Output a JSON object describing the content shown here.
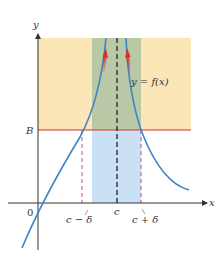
{
  "diagram": {
    "axes": {
      "x_label": "x",
      "y_label": "y",
      "origin_label": "0"
    },
    "labels": {
      "B": "B",
      "c": "c",
      "c_minus_delta": "c − δ",
      "c_plus_delta": "c + δ",
      "curve": "y = f(x)"
    },
    "colors": {
      "upper_region": "#fbe6b8",
      "band_upper": "#b9c9a6",
      "band_lower": "#c9e0f5",
      "B_line": "#d9302a",
      "curve": "#3d84c8",
      "arrow": "#d9302a",
      "delta_lines": "#c0507a",
      "c_line": "#222222",
      "axes": "#333333"
    }
  }
}
